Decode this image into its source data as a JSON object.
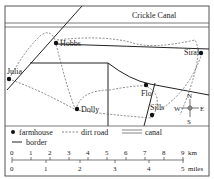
{
  "map": {
    "canal_name": "Crickle Canal",
    "places": {
      "hobbs": "Hobbs",
      "julia": "Julia",
      "siral": "Siral",
      "dolly": "Dolly",
      "flo": "Flo",
      "sills": "Sills"
    },
    "compass": {
      "n": "N",
      "s": "S",
      "e": "E",
      "w": "W"
    }
  },
  "legend": {
    "farmhouse": "farmhouse",
    "dirt_road": "dirt road",
    "canal": "canal",
    "border": "border"
  },
  "scale": {
    "km_ticks": [
      "0",
      "1",
      "2",
      "3",
      "4",
      "5",
      "6",
      "7",
      "8",
      "9"
    ],
    "km_unit": "km",
    "mile_ticks": [
      "0",
      "1",
      "2",
      "3",
      "4",
      "5"
    ],
    "mile_unit": "miles"
  }
}
